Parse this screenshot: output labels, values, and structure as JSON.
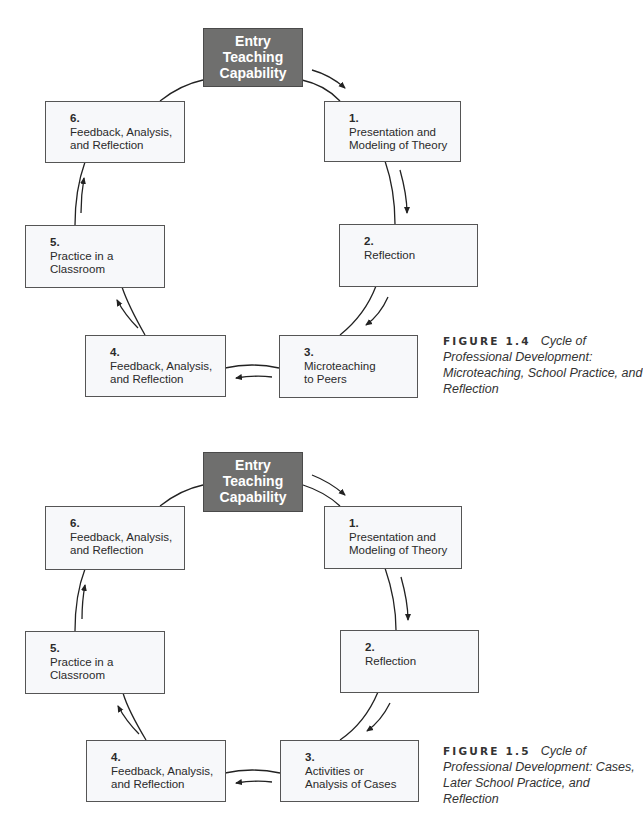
{
  "figures": [
    {
      "id": "figure-1-4",
      "entry": "Entry\nTeaching\nCapability",
      "steps": [
        {
          "num": "1.",
          "label": "Presentation and\nModeling of Theory"
        },
        {
          "num": "2.",
          "label": "Reflection"
        },
        {
          "num": "3.",
          "label": "Microteaching\nto Peers"
        },
        {
          "num": "4.",
          "label": "Feedback, Analysis,\nand Reflection"
        },
        {
          "num": "5.",
          "label": "Practice in a\nClassroom"
        },
        {
          "num": "6.",
          "label": "Feedback, Analysis,\nand Reflection"
        }
      ],
      "caption": {
        "label": "FIGURE 1.4",
        "title": "Cycle of Professional Development: Microteaching, School Practice, and Reflection"
      }
    },
    {
      "id": "figure-1-5",
      "entry": "Entry\nTeaching\nCapability",
      "steps": [
        {
          "num": "1.",
          "label": "Presentation and\nModeling of Theory"
        },
        {
          "num": "2.",
          "label": "Reflection"
        },
        {
          "num": "3.",
          "label": "Activities or\nAnalysis of Cases"
        },
        {
          "num": "4.",
          "label": "Feedback, Analysis,\nand Reflection"
        },
        {
          "num": "5.",
          "label": "Practice in a\nClassroom"
        },
        {
          "num": "6.",
          "label": "Feedback, Analysis,\nand Reflection"
        }
      ],
      "caption": {
        "label": "FIGURE 1.5",
        "title": "Cycle of Professional Development: Cases, Later School Practice, and Reflection"
      }
    }
  ],
  "colors": {
    "entry_fill": "#6f6f6e",
    "box_fill": "#f7f8fa",
    "line": "#222222"
  }
}
